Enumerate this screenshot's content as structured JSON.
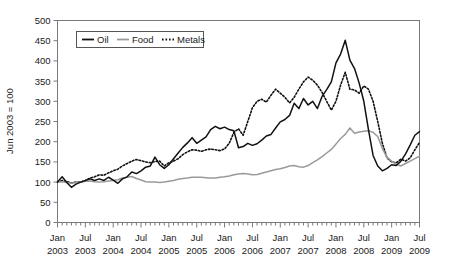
{
  "chart_data": {
    "type": "line",
    "title": "",
    "xlabel": "",
    "ylabel": "Jun 2003 = 100",
    "ylim": [
      0,
      500
    ],
    "ytick_step": 50,
    "yticks": [
      0,
      50,
      100,
      150,
      200,
      250,
      300,
      350,
      400,
      450,
      500
    ],
    "grid": false,
    "legend_position": "top-left",
    "x_start": "Jan 2003",
    "x_end": "Jul 2009",
    "x_tick_interval_months": 1,
    "x_label_interval_months": 6,
    "xtick_labels": [
      {
        "month": "Jan",
        "year": "2003"
      },
      {
        "month": "Jul",
        "year": "2003"
      },
      {
        "month": "Jan",
        "year": "2004"
      },
      {
        "month": "Jul",
        "year": "2004"
      },
      {
        "month": "Jan",
        "year": "2005"
      },
      {
        "month": "Jul",
        "year": "2005"
      },
      {
        "month": "Jan",
        "year": "2006"
      },
      {
        "month": "Jul",
        "year": "2006"
      },
      {
        "month": "Jan",
        "year": "2007"
      },
      {
        "month": "Jul",
        "year": "2007"
      },
      {
        "month": "Jan",
        "year": "2008"
      },
      {
        "month": "Jul",
        "year": "2008"
      },
      {
        "month": "Jan",
        "year": "2009"
      },
      {
        "month": "Jul",
        "year": "2009"
      }
    ],
    "colors": {
      "oil": "#111111",
      "food": "#9a9a9a",
      "metals": "#111111",
      "frame": "#7a7a7a"
    },
    "series": [
      {
        "name": "Oil",
        "style": "solid",
        "color": "#111111",
        "values": [
          100,
          113,
          99,
          87,
          95,
          100,
          104,
          108,
          104,
          108,
          104,
          112,
          105,
          97,
          108,
          113,
          125,
          121,
          128,
          137,
          140,
          162,
          143,
          134,
          143,
          158,
          172,
          186,
          197,
          210,
          196,
          204,
          212,
          230,
          238,
          232,
          236,
          230,
          227,
          185,
          188,
          196,
          191,
          195,
          204,
          214,
          218,
          234,
          249,
          255,
          265,
          295,
          282,
          307,
          291,
          300,
          282,
          312,
          329,
          348,
          395,
          417,
          451,
          402,
          381,
          345,
          300,
          230,
          166,
          140,
          128,
          134,
          143,
          141,
          152,
          170,
          192,
          216,
          225
        ]
      },
      {
        "name": "Food",
        "style": "solid",
        "color": "#9a9a9a",
        "values": [
          100,
          101,
          99,
          97,
          99,
          100,
          102,
          103,
          101,
          100,
          101,
          103,
          104,
          106,
          110,
          112,
          114,
          109,
          105,
          101,
          100,
          100,
          99,
          100,
          102,
          104,
          107,
          109,
          110,
          112,
          112,
          112,
          111,
          110,
          110,
          112,
          113,
          115,
          118,
          120,
          121,
          120,
          118,
          119,
          122,
          125,
          128,
          131,
          133,
          136,
          140,
          141,
          138,
          137,
          141,
          148,
          155,
          163,
          172,
          181,
          194,
          208,
          218,
          234,
          221,
          224,
          226,
          227,
          223,
          213,
          183,
          161,
          152,
          144,
          140,
          146,
          152,
          158,
          164
        ]
      },
      {
        "name": "Metals",
        "style": "dotted",
        "color": "#111111",
        "values": [
          100,
          104,
          101,
          98,
          100,
          100,
          104,
          110,
          113,
          118,
          117,
          123,
          128,
          132,
          140,
          146,
          152,
          156,
          153,
          150,
          148,
          151,
          152,
          140,
          148,
          152,
          158,
          168,
          175,
          180,
          179,
          176,
          180,
          182,
          180,
          178,
          182,
          196,
          223,
          232,
          216,
          250,
          284,
          300,
          305,
          298,
          315,
          330,
          320,
          310,
          296,
          310,
          330,
          348,
          360,
          352,
          340,
          322,
          300,
          278,
          300,
          340,
          372,
          330,
          328,
          320,
          338,
          330,
          300,
          250,
          196,
          160,
          150,
          148,
          157,
          152,
          160,
          180,
          198
        ]
      }
    ]
  },
  "legend": {
    "items": [
      {
        "label": "Oil",
        "style": "solid-black"
      },
      {
        "label": "Food",
        "style": "solid-gray"
      },
      {
        "label": "Metals",
        "style": "dotted-black"
      }
    ]
  },
  "axis": {
    "y_axis_title": "Jun 2003 = 100",
    "y_tick_labels": [
      "500",
      "450",
      "400",
      "350",
      "300",
      "250",
      "200",
      "150",
      "100",
      "50",
      "0"
    ]
  }
}
